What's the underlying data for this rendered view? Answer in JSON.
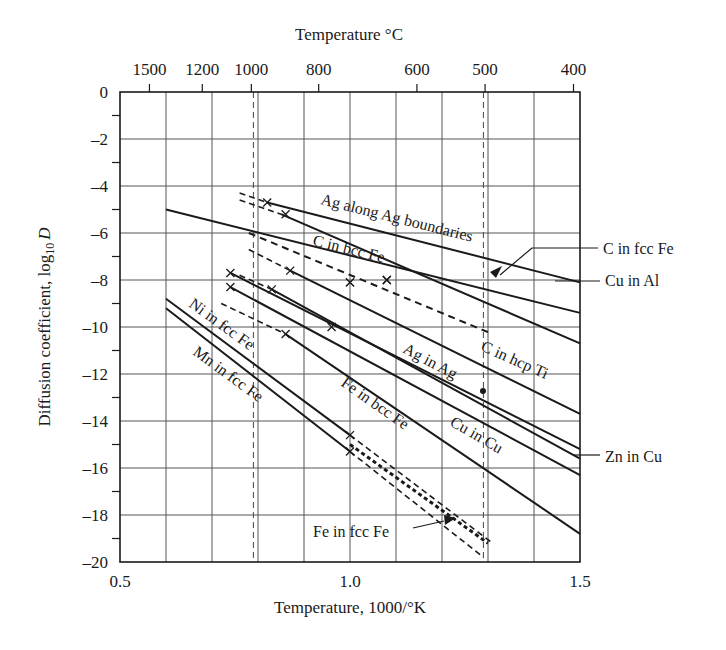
{
  "chart_data": {
    "type": "line",
    "title": "",
    "top_axis_label": "Temperature °C",
    "xlabel": "Temperature, 1000/°K",
    "ylabel": "Diffusion coefficient, log10 D",
    "xlim": [
      0.5,
      1.5
    ],
    "ylim": [
      -20,
      0
    ],
    "x_ticks": [
      0.5,
      1.0,
      1.5
    ],
    "x_tick_labels": [
      "0.5",
      "1.0",
      "1.5"
    ],
    "y_ticks": [
      0,
      -2,
      -4,
      -6,
      -8,
      -10,
      -12,
      -14,
      -16,
      -18,
      -20
    ],
    "y_tick_labels": [
      "0",
      "–2",
      "–4",
      "–6",
      "–8",
      "–10",
      "–12",
      "–14",
      "–16",
      "–18",
      "–20"
    ],
    "top_ticks_celsius": [
      1500,
      1200,
      1000,
      800,
      600,
      500,
      400
    ],
    "top_tick_labels": [
      "1500",
      "1200",
      "1000",
      "800",
      "600",
      "500",
      "400"
    ],
    "grid": true,
    "grid_x_step": 0.1,
    "grid_y_step": 2,
    "reference_dashed_verticals": [
      0.79,
      1.29
    ],
    "series": [
      {
        "name": "Ag along Ag boundaries",
        "style": "solid",
        "points": [
          [
            0.82,
            -4.7
          ],
          [
            1.5,
            -8.1
          ]
        ],
        "dashed_extension": [
          [
            0.76,
            -4.3
          ],
          [
            0.82,
            -4.7
          ]
        ],
        "markers": [
          [
            0.82,
            -4.7
          ]
        ]
      },
      {
        "name": "Cu in Al",
        "style": "solid",
        "points": [
          [
            0.85,
            -5.2
          ],
          [
            1.5,
            -10.7
          ]
        ],
        "dashed_extension": [
          [
            0.76,
            -4.6
          ],
          [
            0.85,
            -5.2
          ]
        ],
        "markers": [
          [
            0.86,
            -5.2
          ]
        ]
      },
      {
        "name": "C in fcc Fe",
        "style": "solid",
        "points": [
          [
            0.6,
            -5.0
          ],
          [
            1.5,
            -9.4
          ]
        ],
        "markers": [
          [
            1.0,
            -8.1
          ],
          [
            1.08,
            -8.0
          ]
        ]
      },
      {
        "name": "C in bcc Fe",
        "style": "dashed",
        "points": [
          [
            0.78,
            -6.0
          ],
          [
            1.31,
            -10.3
          ]
        ],
        "markers": [
          [
            1.08,
            -8.0
          ]
        ]
      },
      {
        "name": "C in hcp Ti",
        "style": "solid",
        "points": [
          [
            0.87,
            -7.6
          ],
          [
            1.5,
            -13.7
          ]
        ],
        "dashed_extension": [
          [
            0.78,
            -6.7
          ],
          [
            0.87,
            -7.6
          ]
        ],
        "markers": [
          [
            0.87,
            -7.6
          ],
          [
            1.0,
            -8.1
          ]
        ]
      },
      {
        "name": "Ag in Ag",
        "style": "solid",
        "points": [
          [
            0.74,
            -7.7
          ],
          [
            1.5,
            -15.2
          ]
        ],
        "markers": [
          [
            0.74,
            -7.7
          ]
        ]
      },
      {
        "name": "Zn in Cu",
        "style": "solid",
        "points": [
          [
            0.83,
            -8.4
          ],
          [
            1.5,
            -15.6
          ]
        ],
        "dashed_extension": [
          [
            0.76,
            -7.8
          ],
          [
            0.83,
            -8.4
          ]
        ],
        "markers": [
          [
            0.83,
            -8.4
          ]
        ]
      },
      {
        "name": "Cu in Cu",
        "style": "solid",
        "points": [
          [
            0.74,
            -8.3
          ],
          [
            1.5,
            -16.3
          ]
        ],
        "markers": [
          [
            0.74,
            -8.3
          ],
          [
            0.96,
            -10.0
          ]
        ]
      },
      {
        "name": "Fe in bcc Fe",
        "style": "solid",
        "points": [
          [
            0.86,
            -10.3
          ],
          [
            1.5,
            -18.8
          ]
        ],
        "dashed_extension": [
          [
            0.72,
            -9.0
          ],
          [
            0.86,
            -10.3
          ]
        ],
        "markers": [
          [
            0.86,
            -10.3
          ]
        ]
      },
      {
        "name": "Ni in fcc Fe",
        "style": "solid",
        "points": [
          [
            0.6,
            -8.8
          ],
          [
            1.0,
            -14.6
          ]
        ],
        "dashed_extension": [
          [
            1.0,
            -14.6
          ],
          [
            1.31,
            -19.2
          ]
        ],
        "markers": [
          [
            1.0,
            -14.6
          ]
        ]
      },
      {
        "name": "Mn in fcc Fe",
        "style": "solid",
        "points": [
          [
            0.6,
            -9.2
          ],
          [
            1.0,
            -15.3
          ]
        ],
        "dashed_extension": [
          [
            1.0,
            -15.3
          ],
          [
            1.29,
            -19.8
          ]
        ],
        "markers": [
          [
            1.0,
            -15.3
          ]
        ]
      },
      {
        "name": "Fe in fcc Fe",
        "style": "dotted",
        "points": [
          [
            1.0,
            -15.0
          ],
          [
            1.3,
            -19.2
          ]
        ]
      }
    ],
    "point_markers": [
      {
        "x": 1.28,
        "y": -12.7,
        "shape": "dot"
      }
    ],
    "annotations": [
      {
        "text": "Ag along Ag boundaries"
      },
      {
        "text": "C in bcc Fe"
      },
      {
        "text": "C in fcc Fe",
        "leader": true
      },
      {
        "text": "Cu in Al",
        "leader": true
      },
      {
        "text": "C in hcp Ti"
      },
      {
        "text": "Ag in Ag"
      },
      {
        "text": "Ni in fcc Fe"
      },
      {
        "text": "Mn in fcc Fe"
      },
      {
        "text": "Fe in bcc Fe"
      },
      {
        "text": "Cu in Cu"
      },
      {
        "text": "Zn in Cu",
        "leader": true
      },
      {
        "text": "Fe in fcc Fe",
        "arrow": true
      }
    ]
  },
  "labels": {
    "top_axis": "Temperature °C",
    "x_axis": "Temperature, 1000/°K",
    "y_axis_main": "Diffusion coefficient, log",
    "y_axis_sub": "10",
    "y_axis_var": "D",
    "ag_boundaries": "Ag along Ag boundaries",
    "c_bcc_fe": "C in bcc Fe",
    "c_fcc_fe": "C in fcc Fe",
    "cu_al": "Cu in Al",
    "c_hcp_ti": "C in hcp Ti",
    "ag_ag": "Ag in Ag",
    "ni_fcc_fe": "Ni in fcc Fe",
    "mn_fcc_fe": "Mn in fcc Fe",
    "fe_bcc_fe": "Fe in bcc Fe",
    "cu_cu": "Cu in Cu",
    "zn_cu": "Zn in Cu",
    "fe_fcc_fe": "Fe in fcc Fe"
  }
}
